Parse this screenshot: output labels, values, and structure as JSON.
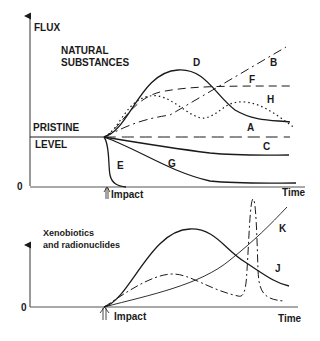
{
  "top_panel": {
    "y_axis_label": "FLUX",
    "x_axis_label": "Time",
    "zero_label": "0",
    "category_label_line1": "NATURAL",
    "category_label_line2": "SUBSTANCES",
    "baseline_label_line1": "PRISTINE",
    "baseline_label_line2": "LEVEL",
    "impact_label": "Impact",
    "curves": [
      {
        "id": "A",
        "label": "A",
        "style": "solid",
        "description": "rises to peak then declines to elevated level"
      },
      {
        "id": "B",
        "label": "B",
        "style": "dash-dot",
        "description": "continuous linear increase"
      },
      {
        "id": "C",
        "label": "C",
        "style": "long-dash",
        "description": "remains at pristine level"
      },
      {
        "id": "D",
        "label": "D",
        "style": "solid",
        "description": "large peak then decline"
      },
      {
        "id": "E",
        "label": "E",
        "style": "solid",
        "description": "rapid drop to zero"
      },
      {
        "id": "F",
        "label": "F",
        "style": "dashed",
        "description": "rises to new plateau"
      },
      {
        "id": "G",
        "label": "G",
        "style": "solid",
        "description": "gradual decrease to lower level"
      },
      {
        "id": "H",
        "label": "H",
        "style": "dotted",
        "description": "oscillating rise"
      }
    ]
  },
  "bottom_panel": {
    "category_label_line1": "Xenobiotics",
    "category_label_line2": "and radionuclides",
    "zero_label": "0",
    "x_axis_label": "Time",
    "impact_label": "Impact",
    "curves": [
      {
        "id": "J",
        "label": "J",
        "style": "solid",
        "description": "peak then decline"
      },
      {
        "id": "K",
        "label": "K",
        "style": "solid-thin",
        "description": "continuous increase"
      },
      {
        "id": "spike",
        "label": "",
        "style": "dash-dot",
        "description": "small peak then sharp spike"
      }
    ]
  }
}
